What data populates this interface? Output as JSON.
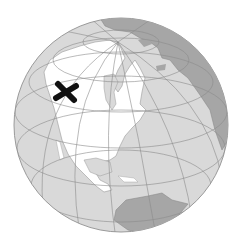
{
  "image": {
    "subject": "globe centered on North America",
    "marker": {
      "label": "X",
      "location": "northwestern North America (Alaska / Yukon)"
    }
  },
  "colors": {
    "background": "#ffffff",
    "ocean": "#d9d9d9",
    "north_america_land": "#ffffff",
    "other_land": "#a6a6a6",
    "grid": "#8c8c8c",
    "outline": "#9a9a9a",
    "marker": "#111111"
  }
}
